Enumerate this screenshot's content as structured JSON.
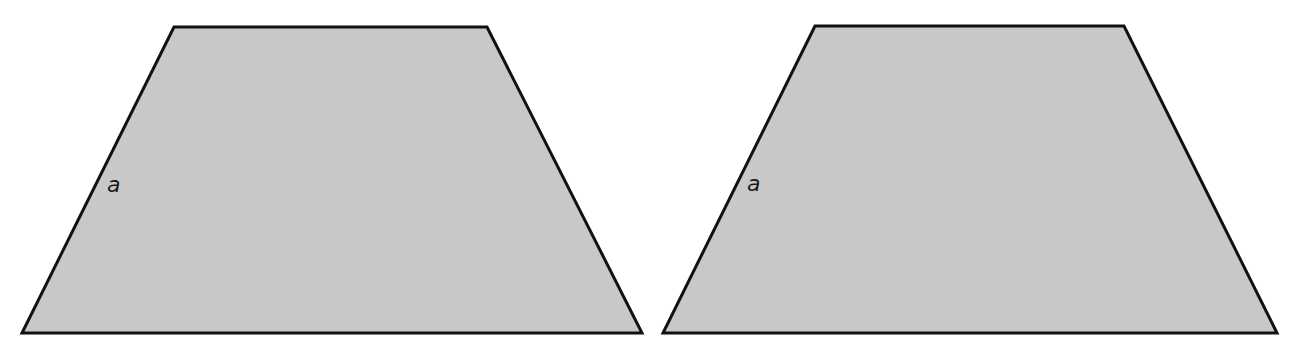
{
  "heading_fragment": "",
  "shapes": [
    {
      "type": "trapezoid",
      "fill": "#c8c8c8",
      "stroke": "#111111",
      "points": [
        [
          174,
          27
        ],
        [
          487,
          27
        ],
        [
          642,
          333
        ],
        [
          22,
          333
        ]
      ],
      "side_label": "a",
      "label_pos": [
        107,
        192
      ]
    },
    {
      "type": "trapezoid",
      "fill": "#c8c8c8",
      "stroke": "#111111",
      "points": [
        [
          815,
          26
        ],
        [
          1124,
          26
        ],
        [
          1277,
          333
        ],
        [
          663,
          333
        ]
      ],
      "side_label": "a",
      "label_pos": [
        747,
        191
      ]
    }
  ]
}
